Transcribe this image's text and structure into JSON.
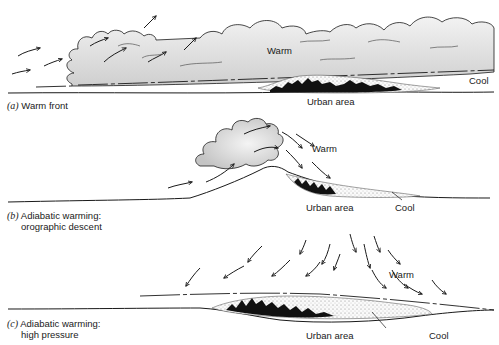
{
  "panels": [
    {
      "id": "a",
      "caption_letter": "(a)",
      "caption_line1": "Warm front",
      "caption_line2": "",
      "labels": {
        "warm": "Warm",
        "urban": "Urban area",
        "cool": "Cool"
      }
    },
    {
      "id": "b",
      "caption_letter": "(b)",
      "caption_line1": "Adiabatic warming:",
      "caption_line2": "orographic descent",
      "labels": {
        "warm": "Warm",
        "urban": "Urban area",
        "cool": "Cool"
      }
    },
    {
      "id": "c",
      "caption_letter": "(c)",
      "caption_line1": "Adiabatic warming:",
      "caption_line2": "high pressure",
      "labels": {
        "warm": "Warm",
        "urban": "Urban area",
        "cool": "Cool"
      }
    }
  ],
  "colors": {
    "cloud_fill": "#d9d9d9",
    "line": "#1a1a1a",
    "urban": "#111111",
    "background": "#ffffff"
  }
}
